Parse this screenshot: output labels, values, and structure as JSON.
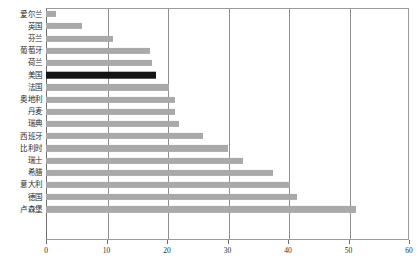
{
  "chart_data": {
    "type": "bar",
    "orientation": "horizontal",
    "title": "",
    "xlabel": "",
    "ylabel": "",
    "xlim": [
      0,
      60
    ],
    "xticks": [
      0,
      10,
      20,
      30,
      40,
      50,
      60
    ],
    "grid": true,
    "legend": false,
    "highlight_category": "美国",
    "colors": {
      "bar": "#a9a9a9",
      "highlight_bar": "#141414",
      "gridline": "#8f8f8f",
      "axis": "#6e6e6e",
      "text": "#2b2b2b",
      "background": "#ffffff"
    },
    "categories": [
      "爱尔兰",
      "英国",
      "芬兰",
      "葡萄牙",
      "荷兰",
      "美国",
      "法国",
      "奥地利",
      "丹麦",
      "瑞典",
      "西班牙",
      "比利时",
      "瑞士",
      "希腊",
      "意大利",
      "德国",
      "卢森堡"
    ],
    "values": [
      1.7,
      6.0,
      11.0,
      17.2,
      17.6,
      18.2,
      20.3,
      21.4,
      21.3,
      22.0,
      26.0,
      30.0,
      32.5,
      37.5,
      40.3,
      41.5,
      51.3
    ]
  }
}
